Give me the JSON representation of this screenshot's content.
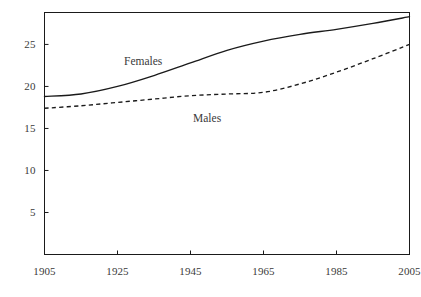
{
  "chart_data": {
    "type": "line",
    "title": "",
    "subtitle": "",
    "xlabel": "",
    "ylabel": "",
    "xlim": [
      1905,
      2005
    ],
    "ylim": [
      0,
      28.8
    ],
    "grid": false,
    "legend": "inline-annotations",
    "x_ticks": [
      "1905",
      "1925",
      "1945",
      "1965",
      "1985",
      "2005"
    ],
    "x_tick_values": [
      1905,
      1925,
      1945,
      1965,
      1985,
      2005
    ],
    "y_ticks": [
      "5",
      "10",
      "15",
      "20",
      "25"
    ],
    "y_tick_values": [
      5,
      10,
      15,
      20,
      25
    ],
    "x": [
      1905,
      1915,
      1925,
      1935,
      1945,
      1955,
      1965,
      1975,
      1985,
      1995,
      2005
    ],
    "series": [
      {
        "name": "Females",
        "style": "solid",
        "color": "#1a1a1a",
        "annotation": "Females",
        "values": [
          18.8,
          19.1,
          20.0,
          21.3,
          22.8,
          24.3,
          25.4,
          26.2,
          26.8,
          27.5,
          28.3
        ]
      },
      {
        "name": "Males",
        "style": "dashed",
        "color": "#1a1a1a",
        "annotation": "Males",
        "values": [
          17.4,
          17.7,
          18.1,
          18.5,
          18.9,
          19.1,
          19.3,
          20.3,
          21.7,
          23.3,
          25.0
        ]
      }
    ]
  },
  "axis": {
    "frame_color": "#1a1a1a",
    "tick_color": "#1a1a1a"
  },
  "annotations": {
    "females_label": "Females",
    "males_label": "Males"
  }
}
